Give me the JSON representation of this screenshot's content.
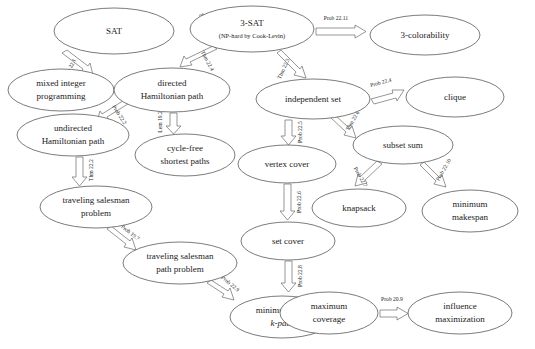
{
  "diagram": {
    "type": "reduction-graph",
    "canvas": {
      "width": 535,
      "height": 349
    },
    "colors": {
      "background": "#ffffff",
      "node_stroke": "#59595b",
      "node_fill": "#ffffff",
      "arrow_stroke": "#6a6a6c",
      "arrow_fill": "#ffffff",
      "text": "#1a1a1a"
    },
    "nodes": [
      {
        "id": "sat",
        "label": "SAT",
        "sublabel": "",
        "cx": 114,
        "cy": 31,
        "rx": 60,
        "ry": 23
      },
      {
        "id": "3sat",
        "label": "3-SAT",
        "sublabel": "(NP-hard by Cook-Levin)",
        "cx": 252,
        "cy": 29,
        "rx": 62,
        "ry": 23
      },
      {
        "id": "3col",
        "label": "3-colorability",
        "sublabel": "",
        "cx": 425,
        "cy": 35,
        "rx": 55,
        "ry": 20
      },
      {
        "id": "mip",
        "label": "mixed integer",
        "sublabel": "programming",
        "cx": 61,
        "cy": 90,
        "rx": 53,
        "ry": 21
      },
      {
        "id": "dhp",
        "label": "directed",
        "sublabel": "Hamiltonian path",
        "cx": 172,
        "cy": 90,
        "rx": 58,
        "ry": 22
      },
      {
        "id": "is",
        "label": "independent set",
        "sublabel": "",
        "cx": 313,
        "cy": 99,
        "rx": 57,
        "ry": 20
      },
      {
        "id": "clique",
        "label": "clique",
        "sublabel": "",
        "cx": 455,
        "cy": 97,
        "rx": 49,
        "ry": 20
      },
      {
        "id": "uhp",
        "label": "undirected",
        "sublabel": "Hamiltonian path",
        "cx": 73,
        "cy": 135,
        "rx": 56,
        "ry": 21
      },
      {
        "id": "cfsp",
        "label": "cycle-free",
        "sublabel": "shortest paths",
        "cx": 185,
        "cy": 155,
        "rx": 50,
        "ry": 21
      },
      {
        "id": "ss",
        "label": "subset sum",
        "sublabel": "",
        "cx": 403,
        "cy": 145,
        "rx": 50,
        "ry": 19
      },
      {
        "id": "vc",
        "label": "vertex cover",
        "sublabel": "",
        "cx": 287,
        "cy": 164,
        "rx": 49,
        "ry": 19
      },
      {
        "id": "tsp",
        "label": "traveling salesman",
        "sublabel": "problem",
        "cx": 96,
        "cy": 207,
        "rx": 56,
        "ry": 21
      },
      {
        "id": "knap",
        "label": "knapsack",
        "sublabel": "",
        "cx": 359,
        "cy": 208,
        "rx": 47,
        "ry": 19
      },
      {
        "id": "makespan",
        "label": "minimum",
        "sublabel": "makespan",
        "cx": 470,
        "cy": 211,
        "rx": 48,
        "ry": 21
      },
      {
        "id": "setcover",
        "label": "set cover",
        "sublabel": "",
        "cx": 288,
        "cy": 241,
        "rx": 47,
        "ry": 19
      },
      {
        "id": "tspp",
        "label": "traveling salesman",
        "sublabel": "path problem",
        "cx": 180,
        "cy": 263,
        "rx": 57,
        "ry": 21
      },
      {
        "id": "kpath",
        "label": "minimum-cost",
        "sublabel": "k-path",
        "sublabel_italic_prefix": "k",
        "cx": 282,
        "cy": 317,
        "rx": 52,
        "ry": 21
      },
      {
        "id": "maxcov",
        "label": "maximum",
        "sublabel": "coverage",
        "cx": 329,
        "cy": 313,
        "rx": 49,
        "ry": 21
      },
      {
        "id": "infmax",
        "label": "influence",
        "sublabel": "maximization",
        "cx": 460,
        "cy": 313,
        "rx": 52,
        "ry": 21
      }
    ],
    "edges": [
      {
        "id": "e-3sat-sat",
        "from": "3sat",
        "to": "sat",
        "label": "obvious"
      },
      {
        "id": "e-3sat-3col",
        "from": "3sat",
        "to": "3col",
        "label": "Prob 22.11"
      },
      {
        "id": "e-3sat-dhp",
        "from": "3sat",
        "to": "dhp",
        "label": "Thm 22.4"
      },
      {
        "id": "e-3sat-is",
        "from": "3sat",
        "to": "is",
        "label": "Thm 22.3"
      },
      {
        "id": "e-sat-mip",
        "from": "sat",
        "to": "mip",
        "label": "Prob 22.1"
      },
      {
        "id": "e-dhp-uhp",
        "from": "dhp",
        "to": "uhp",
        "label": "Prob 22.2"
      },
      {
        "id": "e-dhp-cfsp",
        "from": "dhp",
        "to": "cfsp",
        "label": "Lem 19.2"
      },
      {
        "id": "e-uhp-tsp",
        "from": "uhp",
        "to": "tsp",
        "label": "Thm 22.2"
      },
      {
        "id": "e-tsp-tspp",
        "from": "tsp",
        "to": "tspp",
        "label": "Prob 19.7"
      },
      {
        "id": "e-tspp-kpath",
        "from": "tspp",
        "to": "kpath",
        "label": "Prob 22.9"
      },
      {
        "id": "e-is-clique",
        "from": "is",
        "to": "clique",
        "label": "Prob 22.4"
      },
      {
        "id": "e-is-vc",
        "from": "is",
        "to": "vc",
        "label": "Prob 22.5"
      },
      {
        "id": "e-is-ss",
        "from": "is",
        "to": "ss",
        "label": "Thm 22.6"
      },
      {
        "id": "e-vc-setcover",
        "from": "vc",
        "to": "setcover",
        "label": "Prob 22.6"
      },
      {
        "id": "e-ss-knap",
        "from": "ss",
        "to": "knap",
        "label": "Prob 22.7"
      },
      {
        "id": "e-ss-makespan",
        "from": "ss",
        "to": "makespan",
        "label": "Prob 22.10"
      },
      {
        "id": "e-setcover-maxcov",
        "from": "setcover",
        "to": "maxcov",
        "label": "Prob 22.8"
      },
      {
        "id": "e-maxcov-infmax",
        "from": "maxcov",
        "to": "infmax",
        "label": "Prob 20.9"
      }
    ]
  }
}
